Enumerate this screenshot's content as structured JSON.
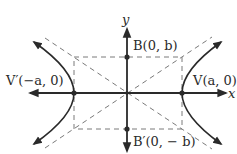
{
  "diagram": {
    "type": "hyperbola",
    "axes": {
      "x_label": "x",
      "y_label": "y"
    },
    "points": {
      "V": {
        "name": "V",
        "coords": "(a, 0)"
      },
      "V_prime": {
        "name": "V′",
        "coords": "(−a, 0)"
      },
      "B": {
        "name": "B",
        "coords": "(0, b)"
      },
      "B_prime": {
        "name": "B′",
        "coords": "(0, −b)"
      }
    },
    "labels": {
      "V": "V(a, 0)",
      "V_prime": "V′(−a, 0)",
      "B": "B(0, b)",
      "B_prime": "B′(0, − b)"
    },
    "colors": {
      "stroke": "#2a2a2a",
      "dashed": "#7a7a7a"
    }
  }
}
